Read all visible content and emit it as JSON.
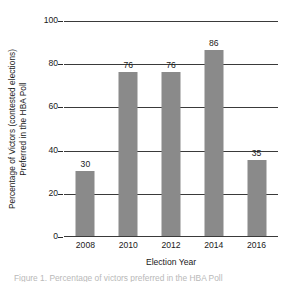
{
  "chart_data": {
    "type": "bar",
    "title": "",
    "subtitle": "",
    "xlabel": "Election Year",
    "ylabel": "Percentage of Victors (contested elections) Preferred in the HBA Poll",
    "ylabel_line1": "Percentage of Victors (contested elections)",
    "ylabel_line2": "Preferred in the HBA Poll",
    "categories": [
      "2008",
      "2010",
      "2012",
      "2014",
      "2016"
    ],
    "values": [
      30,
      76,
      76,
      86,
      35
    ],
    "value_labels": [
      "30",
      "76",
      "76",
      "86",
      "35"
    ],
    "ylim": [
      0,
      100
    ],
    "yticks": [
      0,
      20,
      40,
      60,
      80,
      100
    ],
    "ytick_labels": [
      "0",
      "20",
      "40",
      "60",
      "80",
      "100"
    ],
    "xtick_labels": [
      "2008",
      "2010",
      "2012",
      "2014",
      "2016"
    ],
    "grid": true,
    "grid_axis": "y",
    "legend": false,
    "legend_position": "none",
    "bar_color": "#8a8a8a",
    "grid_color": "#3a3a3a",
    "text_color": "#1a1a1a",
    "background_color": "#ffffff"
  },
  "caption": {
    "text": "Figure 1. Percentage of victors preferred in the HBA Poll"
  }
}
